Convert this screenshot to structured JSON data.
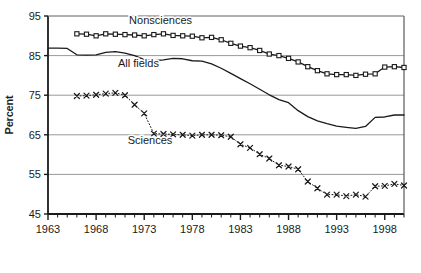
{
  "chart_data": {
    "type": "line",
    "title": "",
    "xlabel": "",
    "ylabel": "Percent",
    "xlim": [
      1963,
      2000
    ],
    "ylim": [
      45,
      95
    ],
    "grid": true,
    "legend_position": "inline-annotations",
    "x_ticks_major": [
      1963,
      1968,
      1973,
      1978,
      1983,
      1988,
      1993,
      1998
    ],
    "x_tick_labels": [
      "1963",
      "1968",
      "1973",
      "1978",
      "1983",
      "1988",
      "1993",
      "1998"
    ],
    "x_minor_tick_step": 1,
    "y_ticks": [
      45,
      55,
      65,
      75,
      85,
      95
    ],
    "y_tick_labels": [
      "45",
      "55",
      "65",
      "75",
      "85",
      "95"
    ],
    "series": [
      {
        "name": "Nonsciences",
        "marker": "square",
        "line_style": "solid",
        "color": "#1a1a1a",
        "label_x": 1974.7,
        "label_y": 93.0,
        "x": [
          1966,
          1967,
          1968,
          1969,
          1970,
          1971,
          1972,
          1973,
          1974,
          1975,
          1976,
          1977,
          1978,
          1979,
          1980,
          1981,
          1982,
          1983,
          1984,
          1985,
          1986,
          1987,
          1988,
          1989,
          1990,
          1991,
          1992,
          1993,
          1994,
          1995,
          1996,
          1997,
          1998,
          1999,
          2000
        ],
        "values": [
          90.5,
          90.4,
          90.0,
          90.5,
          90.4,
          90.3,
          90.2,
          90.0,
          90.3,
          90.5,
          90.1,
          90.0,
          89.9,
          89.5,
          89.6,
          89.0,
          88.1,
          87.4,
          87.0,
          86.3,
          85.4,
          85.0,
          84.3,
          83.4,
          82.2,
          81.2,
          80.4,
          80.2,
          80.2,
          80.0,
          80.3,
          80.4,
          82.1,
          82.2,
          82.0
        ]
      },
      {
        "name": "All fields",
        "marker": "none",
        "line_style": "solid",
        "color": "#1a1a1a",
        "label_x": 1972.4,
        "label_y": 82.2,
        "x": [
          1963,
          1964,
          1965,
          1966,
          1967,
          1968,
          1969,
          1970,
          1971,
          1972,
          1973,
          1974,
          1975,
          1976,
          1977,
          1978,
          1979,
          1980,
          1981,
          1982,
          1983,
          1984,
          1985,
          1986,
          1987,
          1988,
          1989,
          1990,
          1991,
          1992,
          1993,
          1994,
          1995,
          1996,
          1997,
          1998,
          1999,
          2000
        ],
        "values": [
          86.9,
          86.9,
          86.8,
          85.2,
          85.1,
          85.2,
          85.8,
          86.0,
          85.6,
          85.0,
          84.0,
          83.7,
          83.9,
          84.3,
          84.2,
          83.7,
          83.6,
          82.9,
          81.8,
          80.5,
          79.2,
          77.9,
          76.5,
          75.1,
          73.9,
          73.1,
          71.1,
          69.6,
          68.5,
          67.8,
          67.2,
          66.9,
          66.6,
          67.1,
          69.4,
          69.5,
          70.0,
          70.0
        ]
      },
      {
        "name": "Sciences",
        "marker": "x",
        "line_style": "dotted",
        "color": "#1a1a1a",
        "label_x": 1973.6,
        "label_y": 62.6,
        "x": [
          1966,
          1967,
          1968,
          1969,
          1970,
          1971,
          1972,
          1973,
          1974,
          1975,
          1976,
          1977,
          1978,
          1979,
          1980,
          1981,
          1982,
          1983,
          1984,
          1985,
          1986,
          1987,
          1988,
          1989,
          1990,
          1991,
          1992,
          1993,
          1994,
          1995,
          1996,
          1997,
          1998,
          1999,
          2000
        ],
        "values": [
          74.8,
          74.9,
          75.1,
          75.4,
          75.6,
          75.0,
          72.6,
          70.4,
          65.3,
          65.2,
          65.1,
          65.0,
          64.8,
          65.0,
          65.0,
          64.9,
          64.5,
          62.6,
          61.7,
          60.1,
          59.0,
          57.3,
          57.0,
          56.3,
          53.2,
          51.5,
          49.9,
          49.9,
          49.5,
          49.9,
          49.4,
          52.0,
          52.1,
          52.6,
          52.2
        ]
      }
    ]
  }
}
